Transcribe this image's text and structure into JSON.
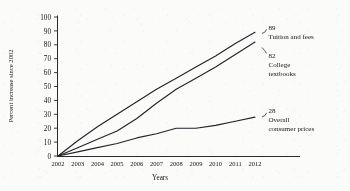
{
  "chart_data": {
    "type": "line",
    "title": "",
    "xlabel": "Years",
    "ylabel": "Percent increase since 2002",
    "x": [
      2002,
      2003,
      2004,
      2005,
      2006,
      2007,
      2008,
      2009,
      2010,
      2011,
      2012
    ],
    "xlim": [
      2002,
      2012
    ],
    "ylim": [
      0,
      100
    ],
    "ytick_values": [
      0,
      10,
      20,
      30,
      40,
      50,
      60,
      70,
      80,
      90,
      100
    ],
    "xtick_labels": [
      "2002",
      "2003",
      "2004",
      "2005",
      "2006",
      "2007",
      "2008",
      "2009",
      "2010",
      "2011",
      "2012"
    ],
    "grid": false,
    "legend_position": "right-inline-callouts",
    "series": [
      {
        "name": "Tuition and fees",
        "end_value": 89,
        "end_label": "89",
        "values": [
          0,
          11,
          21,
          30,
          39,
          48,
          56,
          64,
          72,
          81,
          89
        ]
      },
      {
        "name": "College textbooks",
        "end_value": 82,
        "end_label": "82",
        "values": [
          0,
          6,
          12,
          18,
          27,
          38,
          48,
          56,
          64,
          73,
          82
        ]
      },
      {
        "name": "Overall consumer prices",
        "end_value": 28,
        "end_label": "28",
        "values": [
          0,
          3,
          6,
          9,
          13,
          16,
          20,
          20,
          22,
          25,
          28
        ]
      }
    ]
  },
  "callouts": [
    {
      "value": "89",
      "line1": "Tuition and fees",
      "line2": ""
    },
    {
      "value": "82",
      "line1": "College",
      "line2": "textbooks"
    },
    {
      "value": "28",
      "line1": "Overall",
      "line2": "consumer prices"
    }
  ],
  "colors": {
    "ink": "#23242a",
    "axis": "#2b2b2b",
    "background": "#fbfbfa"
  }
}
